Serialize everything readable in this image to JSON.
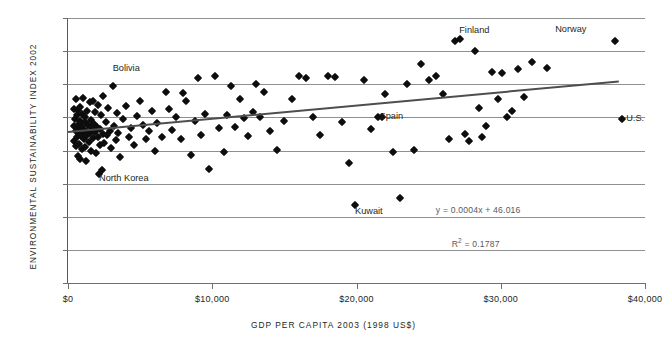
{
  "chart_data": {
    "type": "scatter",
    "title": "",
    "xlabel": "GDP PER CAPITA 2003 (1998 US$)",
    "ylabel": "ENVIRONMENTAL SUSTAINABILITY INDEX 2002",
    "xlim": [
      0,
      40000
    ],
    "ylim": [
      0,
      80
    ],
    "xticks": [
      0,
      10000,
      20000,
      30000,
      40000
    ],
    "xticklabels": [
      "$0",
      "$10,000",
      "$20,000",
      "$30,000",
      "$40,000"
    ],
    "yticks": [
      0,
      10,
      20,
      30,
      40,
      50,
      60,
      70,
      80
    ],
    "yticklabels": [
      "0",
      "10",
      "20",
      "30",
      "40",
      "50",
      "60",
      "70",
      "80"
    ],
    "grid": "horizontal",
    "legend": "none",
    "marker": "diamond",
    "marker_color": "#0d0d0d",
    "trendline": {
      "equation": "y = 0.0004x + 46.016",
      "r_squared_label": "R",
      "r_squared_exp": "2",
      "r_squared_value": "= 0.1787",
      "slope": 0.0004,
      "intercept": 46.016,
      "r2": 0.1787,
      "color": "#4e4e50",
      "x_start": 0,
      "x_end": 38200
    },
    "annotations": [
      {
        "label": "Bolivia",
        "x": 3100,
        "y": 64.5
      },
      {
        "label": "North Korea",
        "x": 2150,
        "y": 31.4
      },
      {
        "label": "Kuwait",
        "x": 19900,
        "y": 21.5
      },
      {
        "label": "Spain",
        "x": 21600,
        "y": 50.0
      },
      {
        "label": "Finland",
        "x": 27400,
        "y": 76.0
      },
      {
        "label": "Norway",
        "x": 35300,
        "y": 76.3
      },
      {
        "label": "U.S.",
        "x": 38700,
        "y": 49.6
      }
    ],
    "points": [
      {
        "x": 400,
        "y": 47.5
      },
      {
        "x": 420,
        "y": 52.6
      },
      {
        "x": 450,
        "y": 43.0
      },
      {
        "x": 500,
        "y": 49.5
      },
      {
        "x": 520,
        "y": 45.8
      },
      {
        "x": 560,
        "y": 41.3
      },
      {
        "x": 580,
        "y": 55.5
      },
      {
        "x": 600,
        "y": 47.0
      },
      {
        "x": 620,
        "y": 50.6
      },
      {
        "x": 650,
        "y": 44.0
      },
      {
        "x": 680,
        "y": 38.2
      },
      {
        "x": 700,
        "y": 46.2
      },
      {
        "x": 720,
        "y": 52.3
      },
      {
        "x": 740,
        "y": 48.1
      },
      {
        "x": 760,
        "y": 42.0
      },
      {
        "x": 800,
        "y": 45.0
      },
      {
        "x": 820,
        "y": 53.2
      },
      {
        "x": 840,
        "y": 37.4
      },
      {
        "x": 860,
        "y": 49.0
      },
      {
        "x": 900,
        "y": 46.6
      },
      {
        "x": 930,
        "y": 44.4
      },
      {
        "x": 950,
        "y": 51.0
      },
      {
        "x": 980,
        "y": 40.5
      },
      {
        "x": 1000,
        "y": 47.2
      },
      {
        "x": 1050,
        "y": 56.0
      },
      {
        "x": 1080,
        "y": 43.5
      },
      {
        "x": 1100,
        "y": 45.5
      },
      {
        "x": 1150,
        "y": 48.5
      },
      {
        "x": 1180,
        "y": 41.0
      },
      {
        "x": 1200,
        "y": 50.2
      },
      {
        "x": 1250,
        "y": 46.0
      },
      {
        "x": 1280,
        "y": 36.8
      },
      {
        "x": 1300,
        "y": 52.0
      },
      {
        "x": 1350,
        "y": 44.8
      },
      {
        "x": 1400,
        "y": 47.8
      },
      {
        "x": 1450,
        "y": 42.6
      },
      {
        "x": 1500,
        "y": 54.6
      },
      {
        "x": 1530,
        "y": 45.2
      },
      {
        "x": 1560,
        "y": 49.2
      },
      {
        "x": 1600,
        "y": 40.0
      },
      {
        "x": 1650,
        "y": 46.8
      },
      {
        "x": 1700,
        "y": 55.0
      },
      {
        "x": 1750,
        "y": 43.8
      },
      {
        "x": 1800,
        "y": 48.0
      },
      {
        "x": 1850,
        "y": 51.5
      },
      {
        "x": 1900,
        "y": 45.6
      },
      {
        "x": 1950,
        "y": 39.2
      },
      {
        "x": 2000,
        "y": 47.0
      },
      {
        "x": 2050,
        "y": 53.8
      },
      {
        "x": 2100,
        "y": 44.2
      },
      {
        "x": 2150,
        "y": 33.0
      },
      {
        "x": 2200,
        "y": 46.4
      },
      {
        "x": 2250,
        "y": 41.6
      },
      {
        "x": 2300,
        "y": 50.8
      },
      {
        "x": 2350,
        "y": 34.0
      },
      {
        "x": 2400,
        "y": 45.0
      },
      {
        "x": 2450,
        "y": 56.4
      },
      {
        "x": 2500,
        "y": 42.4
      },
      {
        "x": 2600,
        "y": 48.6
      },
      {
        "x": 2700,
        "y": 44.6
      },
      {
        "x": 2800,
        "y": 52.8
      },
      {
        "x": 2900,
        "y": 46.0
      },
      {
        "x": 3000,
        "y": 40.8
      },
      {
        "x": 3100,
        "y": 59.6
      },
      {
        "x": 3200,
        "y": 47.4
      },
      {
        "x": 3300,
        "y": 43.2
      },
      {
        "x": 3400,
        "y": 51.2
      },
      {
        "x": 3500,
        "y": 45.4
      },
      {
        "x": 3600,
        "y": 38.0
      },
      {
        "x": 3800,
        "y": 49.4
      },
      {
        "x": 4000,
        "y": 53.5
      },
      {
        "x": 4200,
        "y": 44.0
      },
      {
        "x": 4400,
        "y": 46.8
      },
      {
        "x": 4600,
        "y": 41.8
      },
      {
        "x": 4800,
        "y": 50.4
      },
      {
        "x": 5000,
        "y": 55.0
      },
      {
        "x": 5200,
        "y": 47.6
      },
      {
        "x": 5400,
        "y": 43.4
      },
      {
        "x": 5600,
        "y": 45.8
      },
      {
        "x": 5800,
        "y": 51.8
      },
      {
        "x": 6000,
        "y": 40.0
      },
      {
        "x": 6200,
        "y": 48.4
      },
      {
        "x": 6500,
        "y": 44.0
      },
      {
        "x": 6800,
        "y": 57.8
      },
      {
        "x": 7000,
        "y": 52.6
      },
      {
        "x": 7200,
        "y": 46.2
      },
      {
        "x": 7500,
        "y": 50.0
      },
      {
        "x": 7800,
        "y": 43.6
      },
      {
        "x": 8000,
        "y": 57.4
      },
      {
        "x": 8200,
        "y": 55.0
      },
      {
        "x": 8500,
        "y": 38.6
      },
      {
        "x": 8800,
        "y": 48.8
      },
      {
        "x": 9000,
        "y": 62.0
      },
      {
        "x": 9200,
        "y": 44.6
      },
      {
        "x": 9500,
        "y": 51.0
      },
      {
        "x": 9800,
        "y": 34.4
      },
      {
        "x": 10200,
        "y": 62.6
      },
      {
        "x": 10500,
        "y": 46.8
      },
      {
        "x": 10800,
        "y": 39.4
      },
      {
        "x": 11000,
        "y": 50.6
      },
      {
        "x": 11300,
        "y": 59.4
      },
      {
        "x": 11600,
        "y": 47.2
      },
      {
        "x": 11900,
        "y": 55.6
      },
      {
        "x": 12200,
        "y": 49.8
      },
      {
        "x": 12500,
        "y": 44.4
      },
      {
        "x": 12800,
        "y": 51.6
      },
      {
        "x": 13000,
        "y": 60.0
      },
      {
        "x": 13300,
        "y": 50.0
      },
      {
        "x": 13600,
        "y": 57.6
      },
      {
        "x": 14000,
        "y": 46.0
      },
      {
        "x": 14500,
        "y": 40.2
      },
      {
        "x": 15000,
        "y": 49.0
      },
      {
        "x": 15500,
        "y": 55.4
      },
      {
        "x": 16000,
        "y": 62.4
      },
      {
        "x": 16500,
        "y": 62.0
      },
      {
        "x": 17000,
        "y": 50.2
      },
      {
        "x": 17500,
        "y": 44.8
      },
      {
        "x": 18000,
        "y": 62.4
      },
      {
        "x": 18500,
        "y": 62.2
      },
      {
        "x": 19000,
        "y": 48.6
      },
      {
        "x": 19500,
        "y": 36.2
      },
      {
        "x": 19900,
        "y": 23.4
      },
      {
        "x": 20500,
        "y": 61.2
      },
      {
        "x": 21000,
        "y": 46.6
      },
      {
        "x": 21500,
        "y": 50.0
      },
      {
        "x": 21800,
        "y": 50.2
      },
      {
        "x": 22000,
        "y": 57.2
      },
      {
        "x": 22500,
        "y": 39.4
      },
      {
        "x": 23000,
        "y": 25.8
      },
      {
        "x": 23500,
        "y": 60.0
      },
      {
        "x": 24000,
        "y": 40.2
      },
      {
        "x": 24500,
        "y": 66.0
      },
      {
        "x": 25000,
        "y": 61.4
      },
      {
        "x": 25500,
        "y": 62.6
      },
      {
        "x": 26000,
        "y": 57.2
      },
      {
        "x": 26400,
        "y": 43.6
      },
      {
        "x": 26800,
        "y": 73.0
      },
      {
        "x": 27200,
        "y": 73.8
      },
      {
        "x": 27500,
        "y": 45.0
      },
      {
        "x": 27800,
        "y": 42.8
      },
      {
        "x": 28200,
        "y": 70.0
      },
      {
        "x": 28500,
        "y": 52.8
      },
      {
        "x": 28700,
        "y": 44.2
      },
      {
        "x": 29000,
        "y": 47.4
      },
      {
        "x": 29400,
        "y": 63.6
      },
      {
        "x": 29800,
        "y": 55.6
      },
      {
        "x": 30100,
        "y": 63.4
      },
      {
        "x": 30400,
        "y": 50.0
      },
      {
        "x": 30800,
        "y": 51.8
      },
      {
        "x": 31200,
        "y": 64.6
      },
      {
        "x": 31600,
        "y": 56.2
      },
      {
        "x": 32200,
        "y": 66.6
      },
      {
        "x": 33200,
        "y": 65.0
      },
      {
        "x": 37900,
        "y": 73.2
      },
      {
        "x": 38400,
        "y": 49.6
      }
    ]
  }
}
